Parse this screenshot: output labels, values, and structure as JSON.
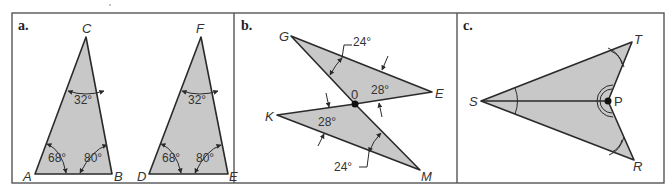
{
  "colors": {
    "fill": "#c8c8c8",
    "stroke": "#2a2a2a",
    "frame": "#555555",
    "background": "#ffffff"
  },
  "panels": [
    {
      "id": "a",
      "label": "a.",
      "triangles": [
        {
          "vertices": {
            "apex": "C",
            "left": "A",
            "right": "B"
          },
          "angles": {
            "apex": "32°",
            "left": "68°",
            "right": "80°"
          }
        },
        {
          "vertices": {
            "apex": "F",
            "left": "D",
            "right": "E"
          },
          "angles": {
            "apex": "32°",
            "left": "68°",
            "right": "80°"
          }
        }
      ]
    },
    {
      "id": "b",
      "label": "b.",
      "points": {
        "G": "G",
        "E": "E",
        "O": "0",
        "K": "K",
        "M": "M"
      },
      "angles": {
        "top": "24°",
        "upper_right": "28°",
        "lower_left": "28°",
        "bottom": "24°"
      }
    },
    {
      "id": "c",
      "label": "c.",
      "points": {
        "S": "S",
        "T": "T",
        "P": "P",
        "R": "R"
      }
    }
  ]
}
